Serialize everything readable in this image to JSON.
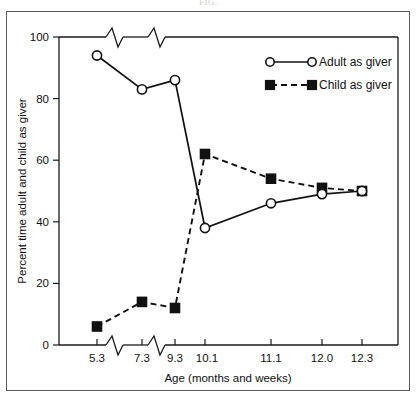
{
  "figure": {
    "running_head": "FIG."
  },
  "chart_data": {
    "type": "line",
    "title": "",
    "xlabel": "Age (months and weeks)",
    "ylabel": "Percent time adult and child as giver",
    "categories": [
      "5.3",
      "7.3",
      "9.3",
      "10.1",
      "11.1",
      "12.0",
      "12.3"
    ],
    "series": [
      {
        "name": "Adult as  giver",
        "marker": "open-circle",
        "line": "solid",
        "values": [
          94,
          83,
          86,
          38,
          46,
          49,
          50
        ]
      },
      {
        "name": "Child as  giver",
        "marker": "filled-square",
        "line": "dashed",
        "values": [
          6,
          14,
          12,
          62,
          54,
          51,
          50
        ]
      }
    ],
    "ylim": [
      0,
      100
    ],
    "yticks": [
      "0",
      "20",
      "40",
      "60",
      "80",
      "100"
    ],
    "ytick_values": [
      0,
      20,
      40,
      60,
      80,
      100
    ],
    "xticks": [
      "5.3",
      "7.3",
      "9.3",
      "10.1",
      "11.1",
      "12.0",
      "12.3"
    ],
    "grid": false,
    "legend_position": "top-right",
    "axis_breaks": {
      "x_between": [
        [
          "5.3",
          "7.3"
        ],
        [
          "7.3",
          "9.3"
        ]
      ],
      "style": "zigzag"
    },
    "colors": {
      "line": "#111111",
      "marker_fill_open": "#ffffff",
      "marker_fill_filled": "#111111",
      "axis": "#1a1a1a",
      "background": "#ffffff",
      "frame": "#5b5b5b"
    }
  },
  "legend": {
    "items": [
      {
        "label": "Adult as  giver",
        "marker": "open-circle",
        "line": "solid"
      },
      {
        "label": "Child as  giver",
        "marker": "filled-square",
        "line": "dashed"
      }
    ]
  }
}
